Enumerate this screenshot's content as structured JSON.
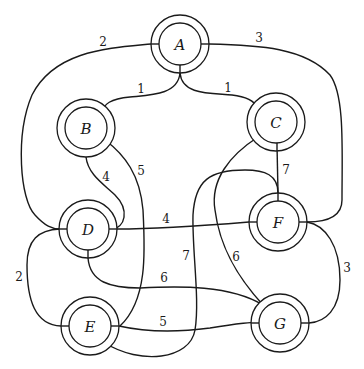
{
  "graph": {
    "type": "weighted-undirected-graph",
    "nodes": [
      {
        "id": "A",
        "label": "A",
        "x": 180,
        "y": 44
      },
      {
        "id": "B",
        "label": "B",
        "x": 86,
        "y": 128
      },
      {
        "id": "C",
        "label": "C",
        "x": 276,
        "y": 122
      },
      {
        "id": "D",
        "label": "D",
        "x": 88,
        "y": 229
      },
      {
        "id": "F",
        "label": "F",
        "x": 278,
        "y": 222
      },
      {
        "id": "E",
        "label": "E",
        "x": 90,
        "y": 326
      },
      {
        "id": "G",
        "label": "G",
        "x": 280,
        "y": 323
      }
    ],
    "edges": [
      {
        "from": "A",
        "to": "B",
        "weight": "1"
      },
      {
        "from": "A",
        "to": "C",
        "weight": "1"
      },
      {
        "from": "A",
        "to": "D",
        "weight": "2"
      },
      {
        "from": "A",
        "to": "F",
        "weight": "3"
      },
      {
        "from": "B",
        "to": "D",
        "weight": "4"
      },
      {
        "from": "B",
        "to": "E",
        "weight": "5"
      },
      {
        "from": "C",
        "to": "F",
        "weight": "7"
      },
      {
        "from": "C",
        "to": "G",
        "weight": "6"
      },
      {
        "from": "D",
        "to": "F",
        "weight": "4"
      },
      {
        "from": "D",
        "to": "G",
        "weight": "6"
      },
      {
        "from": "D",
        "to": "E",
        "weight": "2"
      },
      {
        "from": "F",
        "to": "G",
        "weight": "3"
      },
      {
        "from": "F",
        "to": "E",
        "weight": "7"
      },
      {
        "from": "E",
        "to": "G",
        "weight": "5"
      }
    ]
  },
  "labels": {
    "A": "A",
    "B": "B",
    "C": "C",
    "D": "D",
    "E": "E",
    "F": "F",
    "G": "G",
    "w_AB": "1",
    "w_AC": "1",
    "w_AD": "2",
    "w_AF": "3",
    "w_BD": "4",
    "w_BE": "5",
    "w_CF": "7",
    "w_CG": "6",
    "w_DF": "4",
    "w_DG": "6",
    "w_DE": "2",
    "w_FG": "3",
    "w_FE": "7",
    "w_EG": "5"
  }
}
